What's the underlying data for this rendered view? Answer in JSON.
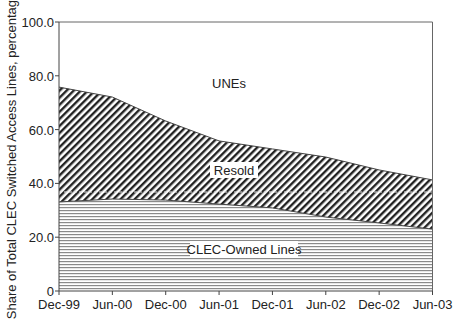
{
  "chart_data": {
    "type": "area",
    "stacked": true,
    "title": "",
    "xlabel": "",
    "ylabel": "Share of Total CLEC Switched Access Lines, percentage",
    "categories": [
      "Dec-99",
      "Jun-00",
      "Dec-00",
      "Jun-01",
      "Dec-01",
      "Jun-02",
      "Dec-02",
      "Jun-03"
    ],
    "ylim": [
      0,
      100
    ],
    "yticks": [
      "0",
      "20.0",
      "40.0",
      "60.0",
      "80.0",
      "100.0"
    ],
    "ytick_values": [
      0,
      20,
      40,
      60,
      80,
      100
    ],
    "grid": false,
    "legend": "none (inline area labels)",
    "series": [
      {
        "name": "CLEC-Owned Lines",
        "pattern": "horizontal-lines",
        "values": [
          33.1,
          34.2,
          33.8,
          32.3,
          30.9,
          27.5,
          25.3,
          23.0
        ]
      },
      {
        "name": "Resold",
        "pattern": "diagonal-lines",
        "values": [
          42.7,
          37.9,
          29.4,
          23.5,
          21.9,
          22.3,
          19.7,
          18.3
        ]
      },
      {
        "name": "UNEs",
        "pattern": "none",
        "values": [
          24.2,
          27.9,
          36.8,
          44.2,
          47.2,
          50.2,
          55.0,
          58.7
        ]
      }
    ],
    "cumulative_top": {
      "owned_plus_resold": [
        75.8,
        72.1,
        63.2,
        55.8,
        52.8,
        49.8,
        45.0,
        41.3
      ]
    },
    "annotations": [
      {
        "text": "UNEs",
        "position": "upper area"
      },
      {
        "text": "Resold",
        "position": "middle area"
      },
      {
        "text": "CLEC-Owned Lines",
        "position": "lower area"
      }
    ]
  },
  "labels": {
    "ylabel": "Share of Total CLEC Switched Access Lines, percentage",
    "unes": "UNEs",
    "resold": "Resold",
    "owned": "CLEC-Owned Lines",
    "x": [
      "Dec-99",
      "Jun-00",
      "Dec-00",
      "Jun-01",
      "Dec-01",
      "Jun-02",
      "Dec-02",
      "Jun-03"
    ],
    "y": [
      "0",
      "20.0",
      "40.0",
      "60.0",
      "80.0",
      "100.0"
    ]
  },
  "colors": {
    "axis": "#555555",
    "hatch_diag": "#222222",
    "hatch_horiz": "#8a8a8a",
    "background": "#ffffff"
  }
}
